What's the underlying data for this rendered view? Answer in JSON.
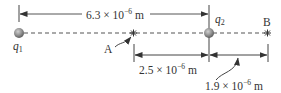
{
  "diagram": {
    "type": "point-charges-on-line",
    "colors": {
      "line": "#555555",
      "charge_fill": "#8c8c8c",
      "text": "#333333"
    },
    "charges": [
      {
        "id": "q1",
        "label_base": "q",
        "label_sub": "1",
        "x_px": 19
      },
      {
        "id": "q2",
        "label_base": "q",
        "label_sub": "2",
        "x_px": 209
      }
    ],
    "points": [
      {
        "id": "A",
        "label": "A",
        "x_px": 133
      },
      {
        "id": "B",
        "label": "B",
        "x_px": 267
      }
    ],
    "dimensions": {
      "q1_q2": {
        "mantissa": "6.3 × 10",
        "exponent": "−6",
        "unit": " m"
      },
      "A_q2": {
        "mantissa": "2.5 × 10",
        "exponent": "−6",
        "unit": " m"
      },
      "q2_B": {
        "mantissa": "1.9 × 10",
        "exponent": "−6",
        "unit": " m"
      }
    }
  }
}
